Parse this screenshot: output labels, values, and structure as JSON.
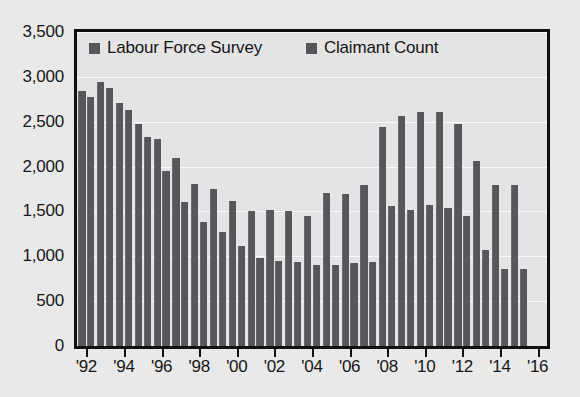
{
  "chart_data": {
    "type": "bar",
    "title": "",
    "subtitle": "",
    "xlabel": "",
    "ylabel": "",
    "grid": true,
    "legend_position": "top-inside",
    "ylim": [
      0,
      3500
    ],
    "ytick_values": [
      0,
      500,
      1000,
      1500,
      2000,
      2500,
      3000,
      3500
    ],
    "ytick_labels": [
      "0",
      "500",
      "1,000",
      "1,500",
      "2,000",
      "2,500",
      "3,000",
      "3,500"
    ],
    "xtick_labels": [
      "'92",
      "'94",
      "'96",
      "'98",
      "'00",
      "'02",
      "'04",
      "'06",
      "'08",
      "'10",
      "'12",
      "'14",
      "'16"
    ],
    "xtick_years": [
      1992,
      1994,
      1996,
      1998,
      2000,
      2002,
      2004,
      2006,
      2008,
      2010,
      2012,
      2014,
      2016
    ],
    "x_axis_start_year": 1991.5,
    "x_axis_end_year": 2016.5,
    "categories": [
      1992,
      1993,
      1994,
      1995,
      1996,
      1997,
      1998,
      1999,
      2000,
      2001,
      2002,
      2003,
      2004,
      2005,
      2006,
      2007,
      2008,
      2009,
      2010,
      2011,
      2012,
      2013,
      2014,
      2015
    ],
    "series": [
      {
        "name": "Labour Force Survey",
        "color": "#56565b",
        "values": [
          2840,
          2940,
          2710,
          2470,
          2310,
          2100,
          1810,
          1750,
          1620,
          1500,
          1520,
          1510,
          1450,
          1710,
          1700,
          1800,
          2440,
          2560,
          2610,
          2610,
          2480,
          2060,
          1800,
          1800
        ]
      },
      {
        "name": "Claimant Count",
        "color": "#56565b",
        "values": [
          2780,
          2880,
          2630,
          2330,
          1950,
          1600,
          1380,
          1270,
          1120,
          980,
          950,
          940,
          900,
          900,
          920,
          940,
          1560,
          1520,
          1570,
          1540,
          1450,
          1070,
          860,
          860
        ]
      }
    ]
  },
  "legend": {
    "entries": [
      {
        "label": "Labour Force Survey",
        "marker": "square-marker"
      },
      {
        "label": "Claimant Count",
        "marker": "square-marker"
      }
    ]
  },
  "colors": {
    "bar": "#56565b",
    "background": "#e9e9e9",
    "plot_background": "#e4e4e4",
    "gridline": "#fafafa",
    "axis": "#111111",
    "text": "#161616"
  }
}
